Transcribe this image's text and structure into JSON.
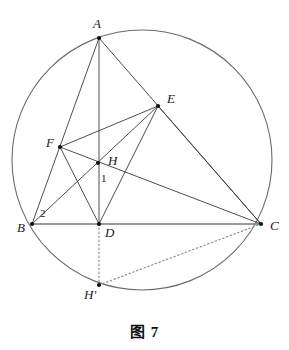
{
  "figure": {
    "caption": "图 7",
    "colors": {
      "stroke": "#3a3a3a",
      "stroke_light": "#6b6b6b",
      "baseline": "#7a7a7a",
      "dotted": "#8a8a8a",
      "vertex_dot": "#111111",
      "label_text": "#1a1a1a",
      "background": "#ffffff"
    },
    "circle": {
      "name": "circumcircle",
      "cx": 142,
      "cy": 160,
      "r": 130
    },
    "points": [
      {
        "id": "A",
        "label": "A",
        "x": 99,
        "y": 38,
        "label_x": 93,
        "label_y": 28,
        "dot": true
      },
      {
        "id": "E",
        "label": "E",
        "x": 158,
        "y": 106,
        "label_x": 167,
        "label_y": 103,
        "dot": true
      },
      {
        "id": "F",
        "label": "F",
        "x": 60,
        "y": 147,
        "label_x": 46,
        "label_y": 147,
        "dot": true
      },
      {
        "id": "H",
        "label": "H",
        "x": 98,
        "y": 163,
        "label_x": 108,
        "label_y": 165,
        "dot": true
      },
      {
        "id": "B",
        "label": "B",
        "x": 32,
        "y": 224,
        "label_x": 17,
        "label_y": 232,
        "dot": true
      },
      {
        "id": "D",
        "label": "D",
        "x": 99,
        "y": 224,
        "label_x": 105,
        "label_y": 237,
        "dot": true
      },
      {
        "id": "C",
        "label": "C",
        "x": 261,
        "y": 224,
        "label_x": 270,
        "label_y": 230,
        "dot": true
      },
      {
        "id": "Hp",
        "label": "H'",
        "x": 99,
        "y": 285,
        "label_x": 84,
        "label_y": 299,
        "dot": true
      }
    ],
    "angle_marks": [
      {
        "id": "angle-1",
        "label": "1",
        "x": 101,
        "y": 182
      },
      {
        "id": "angle-2",
        "label": "2",
        "x": 40,
        "y": 217
      }
    ],
    "segments": [
      {
        "id": "AB",
        "from": "A",
        "to": "B",
        "style": "solid",
        "width": 0.9
      },
      {
        "id": "AD",
        "from": "A",
        "to": "D",
        "style": "solid",
        "width": 0.9
      },
      {
        "id": "AC",
        "from": "A",
        "to": "C",
        "style": "solid",
        "width": 0.9
      },
      {
        "id": "BC",
        "from": "B",
        "to": "C",
        "style": "solid",
        "width": 1.6
      },
      {
        "id": "BE",
        "from": "B",
        "to": "E",
        "style": "solid",
        "width": 0.9
      },
      {
        "id": "FC",
        "from": "F",
        "to": "C",
        "style": "solid",
        "width": 0.9
      },
      {
        "id": "FE",
        "from": "F",
        "to": "E",
        "style": "solid",
        "width": 0.9
      },
      {
        "id": "FD",
        "from": "F",
        "to": "D",
        "style": "solid",
        "width": 0.9
      },
      {
        "id": "ED",
        "from": "E",
        "to": "D",
        "style": "solid",
        "width": 0.9
      },
      {
        "id": "EC",
        "from": "E",
        "to": "C",
        "style": "solid",
        "width": 0.9
      },
      {
        "id": "DHp",
        "from": "D",
        "to": "Hp",
        "style": "dotted",
        "width": 1.1
      },
      {
        "id": "HpC",
        "from": "Hp",
        "to": "C",
        "style": "dotted",
        "width": 1.1
      }
    ]
  }
}
